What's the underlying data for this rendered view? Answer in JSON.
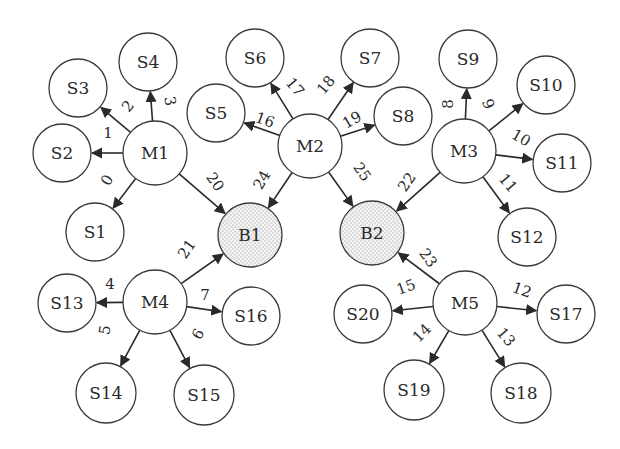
{
  "diagram": {
    "nodes": [
      {
        "id": "M1",
        "label": "M1",
        "x": 155,
        "y": 153,
        "r": 32,
        "type": "machine"
      },
      {
        "id": "M2",
        "label": "M2",
        "x": 310,
        "y": 146,
        "r": 32,
        "type": "machine"
      },
      {
        "id": "M3",
        "label": "M3",
        "x": 464,
        "y": 151,
        "r": 32,
        "type": "machine"
      },
      {
        "id": "M4",
        "label": "M4",
        "x": 155,
        "y": 302,
        "r": 32,
        "type": "machine"
      },
      {
        "id": "M5",
        "label": "M5",
        "x": 465,
        "y": 303,
        "r": 32,
        "type": "machine"
      },
      {
        "id": "B1",
        "label": "B1",
        "x": 250,
        "y": 235,
        "r": 32,
        "type": "buffer"
      },
      {
        "id": "B2",
        "label": "B2",
        "x": 372,
        "y": 233,
        "r": 32,
        "type": "buffer"
      },
      {
        "id": "S1",
        "label": "S1",
        "x": 95,
        "y": 232,
        "r": 29,
        "type": "station"
      },
      {
        "id": "S2",
        "label": "S2",
        "x": 62,
        "y": 153,
        "r": 29,
        "type": "station"
      },
      {
        "id": "S3",
        "label": "S3",
        "x": 78,
        "y": 88,
        "r": 29,
        "type": "station"
      },
      {
        "id": "S4",
        "label": "S4",
        "x": 148,
        "y": 62,
        "r": 29,
        "type": "station"
      },
      {
        "id": "S5",
        "label": "S5",
        "x": 216,
        "y": 113,
        "r": 29,
        "type": "station"
      },
      {
        "id": "S6",
        "label": "S6",
        "x": 255,
        "y": 58,
        "r": 29,
        "type": "station"
      },
      {
        "id": "S7",
        "label": "S7",
        "x": 370,
        "y": 58,
        "r": 29,
        "type": "station"
      },
      {
        "id": "S8",
        "label": "S8",
        "x": 403,
        "y": 116,
        "r": 29,
        "type": "station"
      },
      {
        "id": "S9",
        "label": "S9",
        "x": 468,
        "y": 59,
        "r": 29,
        "type": "station"
      },
      {
        "id": "S10",
        "label": "S10",
        "x": 546,
        "y": 85,
        "r": 29,
        "type": "station"
      },
      {
        "id": "S11",
        "label": "S11",
        "x": 562,
        "y": 163,
        "r": 29,
        "type": "station"
      },
      {
        "id": "S12",
        "label": "S12",
        "x": 527,
        "y": 237,
        "r": 29,
        "type": "station"
      },
      {
        "id": "S13",
        "label": "S13",
        "x": 67,
        "y": 303,
        "r": 29,
        "type": "station"
      },
      {
        "id": "S14",
        "label": "S14",
        "x": 106,
        "y": 393,
        "r": 30,
        "type": "station"
      },
      {
        "id": "S15",
        "label": "S15",
        "x": 204,
        "y": 395,
        "r": 30,
        "type": "station"
      },
      {
        "id": "S16",
        "label": "S16",
        "x": 251,
        "y": 316,
        "r": 29,
        "type": "station"
      },
      {
        "id": "S17",
        "label": "S17",
        "x": 566,
        "y": 314,
        "r": 29,
        "type": "station"
      },
      {
        "id": "S18",
        "label": "S18",
        "x": 521,
        "y": 393,
        "r": 30,
        "type": "station"
      },
      {
        "id": "S19",
        "label": "S19",
        "x": 414,
        "y": 390,
        "r": 30,
        "type": "station"
      },
      {
        "id": "S20",
        "label": "S20",
        "x": 363,
        "y": 314,
        "r": 29,
        "type": "station"
      }
    ],
    "edges": [
      {
        "label": "0",
        "from": "M1",
        "to": "S1",
        "lx": 107,
        "ly": 180,
        "rot": -60
      },
      {
        "label": "1",
        "from": "M1",
        "to": "S2",
        "lx": 108,
        "ly": 133,
        "rot": 0
      },
      {
        "label": "2",
        "from": "M1",
        "to": "S3",
        "lx": 128,
        "ly": 106,
        "rot": -50
      },
      {
        "label": "3",
        "from": "M1",
        "to": "S4",
        "lx": 170,
        "ly": 101,
        "rot": 80
      },
      {
        "label": "4",
        "from": "M4",
        "to": "S13",
        "lx": 110,
        "ly": 284,
        "rot": 0
      },
      {
        "label": "5",
        "from": "M4",
        "to": "S14",
        "lx": 105,
        "ly": 330,
        "rot": -80
      },
      {
        "label": "6",
        "from": "M4",
        "to": "S15",
        "lx": 198,
        "ly": 334,
        "rot": -60
      },
      {
        "label": "7",
        "from": "M4",
        "to": "S16",
        "lx": 205,
        "ly": 295,
        "rot": 0
      },
      {
        "label": "8",
        "from": "M3",
        "to": "S9",
        "lx": 448,
        "ly": 104,
        "rot": -90
      },
      {
        "label": "9",
        "from": "M3",
        "to": "S10",
        "lx": 488,
        "ly": 104,
        "rot": 70
      },
      {
        "label": "10",
        "from": "M3",
        "to": "S11",
        "lx": 521,
        "ly": 138,
        "rot": 30
      },
      {
        "label": "11",
        "from": "M3",
        "to": "S12",
        "lx": 508,
        "ly": 183,
        "rot": 50
      },
      {
        "label": "12",
        "from": "M5",
        "to": "S17",
        "lx": 522,
        "ly": 290,
        "rot": 20
      },
      {
        "label": "13",
        "from": "M5",
        "to": "S18",
        "lx": 506,
        "ly": 337,
        "rot": 50
      },
      {
        "label": "14",
        "from": "M5",
        "to": "S19",
        "lx": 422,
        "ly": 333,
        "rot": -45
      },
      {
        "label": "15",
        "from": "M5",
        "to": "S20",
        "lx": 406,
        "ly": 287,
        "rot": -20
      },
      {
        "label": "16",
        "from": "M2",
        "to": "S5",
        "lx": 265,
        "ly": 120,
        "rot": 20
      },
      {
        "label": "17",
        "from": "M2",
        "to": "S6",
        "lx": 295,
        "ly": 87,
        "rot": 50
      },
      {
        "label": "18",
        "from": "M2",
        "to": "S7",
        "lx": 326,
        "ly": 85,
        "rot": -50
      },
      {
        "label": "19",
        "from": "M2",
        "to": "S8",
        "lx": 352,
        "ly": 120,
        "rot": -30
      },
      {
        "label": "20",
        "from": "M1",
        "to": "B1",
        "lx": 215,
        "ly": 182,
        "rot": 55
      },
      {
        "label": "21",
        "from": "M4",
        "to": "B1",
        "lx": 187,
        "ly": 249,
        "rot": -55
      },
      {
        "label": "22",
        "from": "M3",
        "to": "B2",
        "lx": 407,
        "ly": 182,
        "rot": -55
      },
      {
        "label": "23",
        "from": "M5",
        "to": "B2",
        "lx": 428,
        "ly": 258,
        "rot": 55
      },
      {
        "label": "24",
        "from": "M2",
        "to": "B1",
        "lx": 262,
        "ly": 180,
        "rot": -60
      },
      {
        "label": "25",
        "from": "M2",
        "to": "B2",
        "lx": 362,
        "ly": 172,
        "rot": 55
      }
    ]
  }
}
